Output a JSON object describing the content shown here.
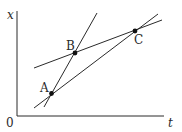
{
  "diagram": {
    "axes": {
      "y_label": "x",
      "x_label": "t",
      "origin_label": "0"
    },
    "points": [
      {
        "label": "A",
        "x": 51.5,
        "y": 93.5
      },
      {
        "label": "B",
        "x": 75,
        "y": 53
      },
      {
        "label": "C",
        "x": 135,
        "y": 31
      }
    ],
    "lines": [
      {
        "name": "line-through-A-B",
        "x1": 44,
        "y1": 107,
        "x2": 97,
        "y2": 13
      },
      {
        "name": "line-through-A-C",
        "x1": 34,
        "y1": 108,
        "x2": 158,
        "y2": 14
      },
      {
        "name": "line-through-B-C",
        "x1": 34,
        "y1": 68,
        "x2": 162,
        "y2": 20
      }
    ],
    "colors": {
      "stroke": "#2a2a2a",
      "background": "#ffffff"
    }
  }
}
